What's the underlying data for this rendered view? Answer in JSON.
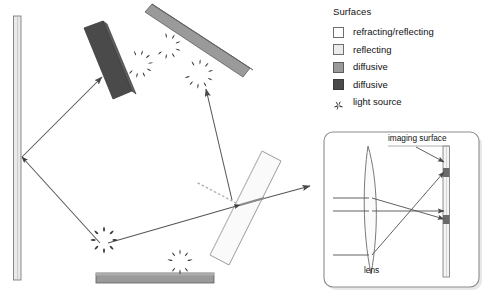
{
  "legend": {
    "title": "Surfaces",
    "items": [
      {
        "label": "refracting/reflecting",
        "swatch": "white-square-icon",
        "color": "#fdfdfd"
      },
      {
        "label": "reflecting",
        "swatch": "light-gray-square-icon",
        "color": "#ebebeb"
      },
      {
        "label": "diffusive",
        "swatch": "mid-gray-square-icon",
        "color": "#9a9a9a"
      },
      {
        "label": "diffusive",
        "swatch": "dark-gray-square-icon",
        "color": "#4a4a4a"
      },
      {
        "label": "light source",
        "swatch": "starburst-icon",
        "color": "#333333"
      }
    ]
  },
  "inset": {
    "imaging_surface_label": "imaging surface",
    "lens_label": "lens"
  },
  "colors": {
    "ray": "#555555",
    "dotted_ray": "#b4b4b4",
    "reflecting_surface": "#e9e9e9",
    "diffusive_mid": "#9a9a9a",
    "diffusive_dark": "#4a4a4a",
    "refracting_surface": "#fafafa",
    "inset_border": "#8c8c8c",
    "outline": "#6e6e6e"
  }
}
